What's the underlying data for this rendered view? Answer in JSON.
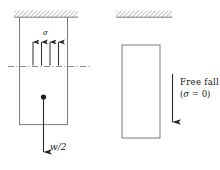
{
  "figure": {
    "background": "#ffffff",
    "line_color": "#555555",
    "arrow_color": "#404040",
    "hatch_color": "#9a9a9a",
    "text_color": "#1a1a1a"
  },
  "left_panel": {
    "name": "hanging-bar",
    "ceiling": {
      "label": "hatched-ceiling",
      "x": 14,
      "y": 10,
      "width": 64,
      "height": 7
    },
    "bar": {
      "x": 19,
      "y": 17,
      "width": 49,
      "height": 108
    },
    "stress_label": "σ",
    "stress_arrow_count": 4,
    "cut_line_label": "dash-dot-section-cut",
    "weight_label": "w/2",
    "weight_numerator": "w",
    "weight_slash": "/",
    "weight_denominator": "2"
  },
  "right_panel": {
    "name": "free-falling-bar",
    "ceiling": {
      "label": "hatched-ceiling",
      "x": 116,
      "y": 10,
      "width": 56,
      "height": 7
    },
    "bar": {
      "x": 122,
      "y": 45,
      "width": 38,
      "height": 93
    },
    "annotation_line1": "Free fall",
    "annotation_line2_open": "(",
    "annotation_line2_sigma": "σ",
    "annotation_line2_eq": " = 0)",
    "annotation_full": "Free fall (σ = 0)"
  }
}
